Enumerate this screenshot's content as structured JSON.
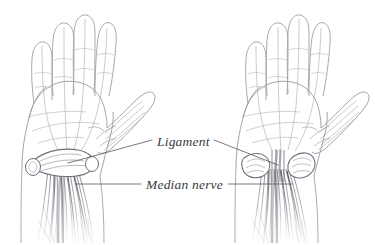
{
  "illustration": {
    "title": "Carpal tunnel anatomy — transverse carpal ligament and median nerve",
    "background_color": "#ffffff",
    "width": 375,
    "height": 245,
    "style": "pen-and-ink medical line drawing",
    "line_color": "#9a9aa5",
    "shade_color": "#5a5a63",
    "text_color": "#3a3a42"
  },
  "labels": {
    "ligament": "Ligament",
    "median_nerve": "Median nerve"
  },
  "figures": [
    {
      "name": "left-hand",
      "side": "left",
      "view": "palmar (palm up)",
      "state": "ligament intact",
      "parts": [
        "thumb",
        "index-finger",
        "middle-finger",
        "ring-finger",
        "little-finger",
        "palm",
        "wrist",
        "forearm",
        "transverse-carpal-ligament",
        "median-nerve",
        "flexor-tendons"
      ]
    },
    {
      "name": "right-hand",
      "side": "right",
      "view": "palmar (palm up)",
      "state": "ligament released / divided",
      "parts": [
        "thumb",
        "index-finger",
        "middle-finger",
        "ring-finger",
        "little-finger",
        "palm",
        "wrist",
        "forearm",
        "divided-ligament-ends",
        "median-nerve",
        "flexor-tendons"
      ]
    }
  ],
  "leader_lines": [
    {
      "name": "ligament-leader-left",
      "from": "Ligament label",
      "to": "left hand wrist ligament"
    },
    {
      "name": "ligament-leader-right",
      "from": "Ligament label",
      "to": "right hand divided ligament"
    },
    {
      "name": "median-nerve-leader-left",
      "from": "Median nerve label",
      "to": "left hand median nerve"
    },
    {
      "name": "median-nerve-leader-right",
      "from": "Median nerve label",
      "to": "right hand median nerve"
    }
  ]
}
